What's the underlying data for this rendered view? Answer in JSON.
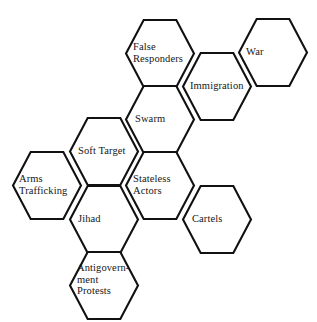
{
  "diagram": {
    "background_color": "#ffffff",
    "stroke_color": "#111111",
    "fill_color": "#ffffff",
    "text_color": "#161616",
    "hex_width": 68,
    "hex_height": 67,
    "column_pitch": 57,
    "row_pitch": 66,
    "orientation": "flat-top",
    "nodes": [
      {
        "id": "false-responders",
        "label": "False\nResponders",
        "label_lines": [
          "False",
          "Responders"
        ],
        "left_vertex_x": 126,
        "top_y": 20,
        "label_x": 133,
        "label_y": 41
      },
      {
        "id": "war",
        "label": "War",
        "label_lines": [
          "War"
        ],
        "left_vertex_x": 239,
        "top_y": 19,
        "label_x": 246,
        "label_y": 46
      },
      {
        "id": "immigration",
        "label": "Immigration",
        "label_lines": [
          "Immigration"
        ],
        "left_vertex_x": 183,
        "top_y": 53,
        "label_x": 190,
        "label_y": 80
      },
      {
        "id": "swarm",
        "label": "Swarm",
        "label_lines": [
          "Swarm"
        ],
        "left_vertex_x": 126,
        "top_y": 86,
        "label_x": 135,
        "label_y": 113
      },
      {
        "id": "soft-target",
        "label": "Soft Target",
        "label_lines": [
          "Soft Target"
        ],
        "left_vertex_x": 70,
        "top_y": 118,
        "label_x": 78,
        "label_y": 145
      },
      {
        "id": "stateless-actors",
        "label": "Stateless\nActors",
        "label_lines": [
          "Stateless",
          "Actors"
        ],
        "left_vertex_x": 126,
        "top_y": 152,
        "label_x": 133,
        "label_y": 173
      },
      {
        "id": "arms-trafficking",
        "label": "Arms\nTrafficking",
        "label_lines": [
          "Arms",
          "Trafficking"
        ],
        "left_vertex_x": 13,
        "top_y": 152,
        "label_x": 19,
        "label_y": 173
      },
      {
        "id": "cartels",
        "label": "Cartels",
        "label_lines": [
          "Cartels"
        ],
        "left_vertex_x": 183,
        "top_y": 186,
        "label_x": 192,
        "label_y": 213
      },
      {
        "id": "jihad",
        "label": "Jihad",
        "label_lines": [
          "Jihad"
        ],
        "left_vertex_x": 70,
        "top_y": 186,
        "label_x": 78,
        "label_y": 213
      },
      {
        "id": "antigovernment-protests",
        "label": "Antigovern-\nment\nProtests",
        "label_lines": [
          "Antigovern-",
          "ment",
          "Protests"
        ],
        "left_vertex_x": 70,
        "top_y": 252,
        "label_x": 77,
        "label_y": 262
      }
    ]
  }
}
